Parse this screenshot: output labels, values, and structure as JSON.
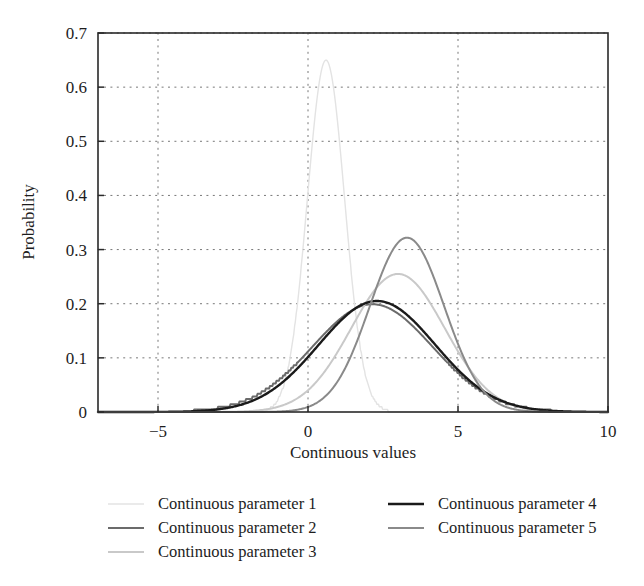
{
  "chart_data": {
    "type": "line",
    "title": "",
    "xlabel": "Continuous values",
    "ylabel": "Probability",
    "xlim": [
      -7,
      10
    ],
    "ylim": [
      0,
      0.7
    ],
    "grid": true,
    "grid_style": "dotted",
    "legend_position": "below-plot",
    "x_ticks": [
      "−5",
      "0",
      "5",
      "10"
    ],
    "x_tick_values": [
      -5,
      0,
      5,
      10
    ],
    "y_ticks": [
      "0",
      "0.1",
      "0.2",
      "0.3",
      "0.4",
      "0.5",
      "0.6",
      "0.7"
    ],
    "y_tick_values": [
      0,
      0.1,
      0.2,
      0.3,
      0.4,
      0.5,
      0.6,
      0.7
    ],
    "series": [
      {
        "name": "Continuous parameter 1",
        "color": "#e3e3e3",
        "width": 1.4,
        "distribution": "normal",
        "mean": 0.6,
        "sigma": 0.62,
        "peak": 0.65,
        "stepped": true
      },
      {
        "name": "Continuous parameter 2",
        "color": "#6b6b6b",
        "width": 2.0,
        "distribution": "normal",
        "mean": 2.15,
        "sigma": 2.0,
        "peak": 0.199,
        "stepped": true
      },
      {
        "name": "Continuous parameter 3",
        "color": "#c9c9c9",
        "width": 2.0,
        "distribution": "normal",
        "mean": 3.0,
        "sigma": 1.56,
        "peak": 0.255,
        "stepped": false
      },
      {
        "name": "Continuous parameter 4",
        "color": "#1a1a1a",
        "width": 2.4,
        "distribution": "normal",
        "mean": 2.3,
        "sigma": 1.94,
        "peak": 0.205,
        "stepped": false
      },
      {
        "name": "Continuous parameter 5",
        "color": "#8a8a8a",
        "width": 2.0,
        "distribution": "normal",
        "mean": 3.3,
        "sigma": 1.24,
        "peak": 0.322,
        "stepped": false
      }
    ],
    "legend_columns": [
      [
        "Continuous parameter 1",
        "Continuous parameter 2",
        "Continuous parameter 3"
      ],
      [
        "Continuous parameter 4",
        "Continuous parameter 5"
      ]
    ]
  }
}
